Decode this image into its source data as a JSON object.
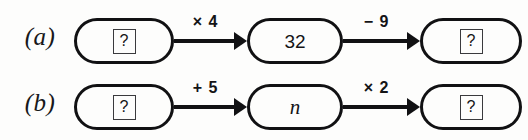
{
  "diagram": {
    "type": "function-machine-chain",
    "rows": [
      {
        "label": "(a)",
        "nodes": [
          {
            "value": "?",
            "boxed": true,
            "italic": false
          },
          {
            "value": "32",
            "boxed": false,
            "italic": false
          },
          {
            "value": "?",
            "boxed": true,
            "italic": false
          }
        ],
        "arrows": [
          {
            "label": "× 4"
          },
          {
            "label": "− 9"
          }
        ]
      },
      {
        "label": "(b)",
        "nodes": [
          {
            "value": "?",
            "boxed": true,
            "italic": false
          },
          {
            "value": "n",
            "boxed": false,
            "italic": true
          },
          {
            "value": "?",
            "boxed": true,
            "italic": false
          }
        ],
        "arrows": [
          {
            "label": "+ 5"
          },
          {
            "label": "× 2"
          }
        ]
      }
    ]
  },
  "colors": {
    "background": "#fdfdfc",
    "stroke": "#111113",
    "text": "#141416",
    "box_border": "#3a3a3d"
  }
}
